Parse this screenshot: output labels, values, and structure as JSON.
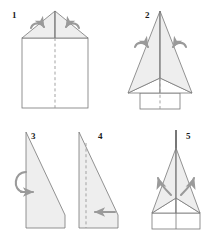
{
  "figure": {
    "background_color": "#ffffff",
    "paper_fill": "#eeeeee",
    "paper_fill_light": "#ffffff",
    "outline_color": "#777777",
    "fold_line_color": "#999999",
    "arrow_color": "#9a9a9a",
    "number_color": "#1a1a1a"
  },
  "steps": [
    {
      "number": "1",
      "label": "fold-top-corners-to-center",
      "shape": "square-with-two-top-triangle-flaps",
      "fold_line": "vertical-dashed-center",
      "arrows": "two-curved-arrows-pointing-inward-down"
    },
    {
      "number": "2",
      "label": "fold-upper-edges-to-center-line",
      "shape": "kite-with-lower-rectangle",
      "fold_line": "vertical-dashed-center-lower",
      "arrows": "two-curved-arrows-pointing-inward"
    },
    {
      "number": "3",
      "label": "fold-in-half-and-turn-over",
      "shape": "right-triangle-profile",
      "fold_line": "none",
      "arrows": "loop-arrow-pointing-right"
    },
    {
      "number": "4",
      "label": "fold-wing-down-along-dashed-line",
      "shape": "right-triangle-profile-with-fold",
      "fold_line": "vertical-dashed-left",
      "arrows": "straight-arrow-pointing-left"
    },
    {
      "number": "5",
      "label": "open-out-wings-finished-plane",
      "shape": "finished-paper-airplane-top-view",
      "fold_line": "vertical-center-fin",
      "arrows": "two-curved-arrows-pointing-outward-up"
    }
  ]
}
